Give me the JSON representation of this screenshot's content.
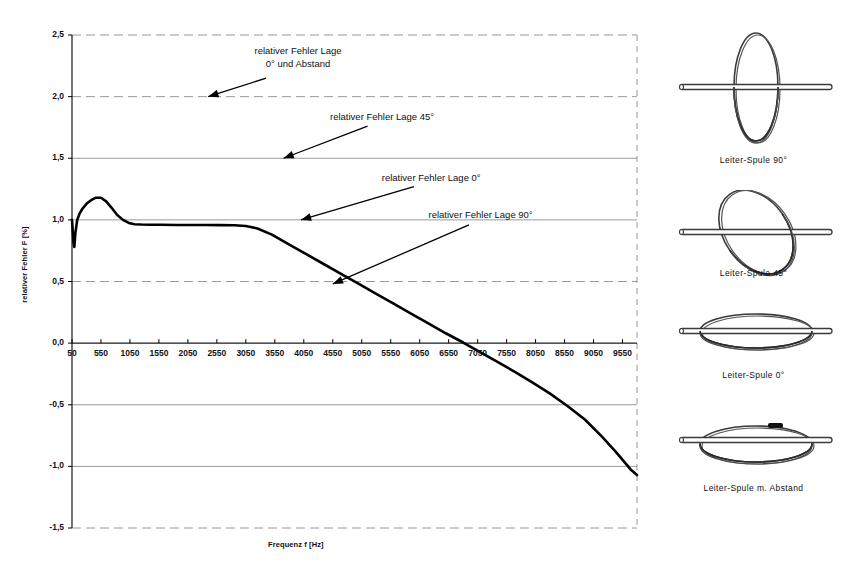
{
  "chart_data": {
    "type": "line",
    "title": "",
    "xlabel": "Frequenz f [Hz]",
    "ylabel": "relativer Fehler F [%]",
    "xlim": [
      50,
      9800
    ],
    "ylim": [
      -1.5,
      2.5
    ],
    "grid": true,
    "legend_position": "none",
    "xticks": [
      50,
      550,
      1050,
      1550,
      2050,
      2550,
      3050,
      3550,
      4050,
      4550,
      5050,
      5550,
      6050,
      6550,
      7050,
      7550,
      8050,
      8550,
      9050,
      9550
    ],
    "xtick_labels": [
      "50",
      "550",
      "1050",
      "1550",
      "2050",
      "2550",
      "3050",
      "3550",
      "4050",
      "4550",
      "5050",
      "5550",
      "6050",
      "6550",
      "7050",
      "7550",
      "8050",
      "8550",
      "9050",
      "9550"
    ],
    "yticks": [
      -1.5,
      -1.0,
      -0.5,
      0.0,
      0.5,
      1.0,
      1.5,
      2.0,
      2.5
    ],
    "ytick_labels": [
      "-1,5",
      "-1,0",
      "-0,5",
      "0,0",
      "0,5",
      "1,0",
      "1,5",
      "2,0",
      "2,5"
    ],
    "series": [
      {
        "name": "relativer Fehler",
        "color": "#000000",
        "x": [
          50,
          60,
          75,
          90,
          110,
          140,
          180,
          230,
          300,
          380,
          460,
          550,
          640,
          730,
          830,
          930,
          1030,
          1130,
          1250,
          1400,
          1600,
          1850,
          2100,
          2350,
          2600,
          2850,
          3050,
          3250,
          3500,
          3800,
          4100,
          4400,
          4700,
          5000,
          5300,
          5600,
          5900,
          6200,
          6500,
          6800,
          7100,
          7400,
          7700,
          8000,
          8300,
          8600,
          8900,
          9200,
          9450,
          9700,
          9800
        ],
        "y": [
          1.0,
          0.93,
          0.82,
          0.78,
          0.9,
          1.0,
          1.05,
          1.09,
          1.13,
          1.16,
          1.18,
          1.18,
          1.15,
          1.1,
          1.04,
          1.0,
          0.975,
          0.965,
          0.962,
          0.961,
          0.96,
          0.959,
          0.958,
          0.958,
          0.957,
          0.956,
          0.95,
          0.93,
          0.88,
          0.8,
          0.72,
          0.64,
          0.56,
          0.48,
          0.4,
          0.32,
          0.24,
          0.16,
          0.08,
          0.005,
          -0.075,
          -0.155,
          -0.235,
          -0.32,
          -0.41,
          -0.51,
          -0.62,
          -0.76,
          -0.89,
          -1.03,
          -1.07
        ]
      }
    ],
    "annotations": [
      {
        "id": "annot-0deg-abstand",
        "lines": [
          "relativer Fehler Lage",
          "0° und Abstand"
        ],
        "text_x": 3950,
        "text_y": 2.32,
        "arrow_from_x": 3400,
        "arrow_from_y": 2.15,
        "arrow_to_x": 2400,
        "arrow_to_y": 2.0
      },
      {
        "id": "annot-45deg",
        "lines": [
          "relativer Fehler Lage 45°"
        ],
        "text_x": 5400,
        "text_y": 1.84,
        "arrow_from_x": 5150,
        "arrow_from_y": 1.76,
        "arrow_to_x": 3700,
        "arrow_to_y": 1.5
      },
      {
        "id": "annot-0deg",
        "lines": [
          "relativer Fehler Lage 0°"
        ],
        "text_x": 6250,
        "text_y": 1.34,
        "arrow_from_x": 5950,
        "arrow_from_y": 1.27,
        "arrow_to_x": 4000,
        "arrow_to_y": 1.0
      },
      {
        "id": "annot-90deg",
        "lines": [
          "relativer Fehler Lage 90°"
        ],
        "text_x": 7100,
        "text_y": 1.04,
        "arrow_from_x": 6900,
        "arrow_from_y": 0.96,
        "arrow_to_x": 4550,
        "arrow_to_y": 0.48
      }
    ]
  },
  "illustrations": [
    {
      "id": "leiter-spule-90",
      "caption": "Leiter-Spule 90°",
      "coil_angle": 90
    },
    {
      "id": "leiter-spule-45",
      "caption": "Leiter-Spule 45°",
      "coil_angle": 55
    },
    {
      "id": "leiter-spule-0",
      "caption": "Leiter-Spule 0°",
      "coil_angle": 0
    },
    {
      "id": "leiter-spule-abstand",
      "caption": "Leiter-Spule m. Abstand",
      "coil_angle": 0
    }
  ],
  "colors": {
    "curve": "#000000",
    "grid": "#7f7f7f",
    "axis": "#000000",
    "text": "#111111",
    "background": "#ffffff"
  }
}
